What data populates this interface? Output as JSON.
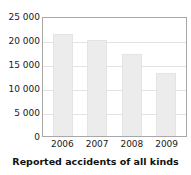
{
  "chart_data": {
    "type": "bar",
    "title": "Reported accidents of all kinds",
    "xlabel": "",
    "ylabel": "",
    "categories": [
      "2006",
      "2007",
      "2008",
      "2009"
    ],
    "values": [
      21200,
      20000,
      17100,
      13200
    ],
    "ylim": [
      0,
      25000
    ],
    "ytick_values": [
      25000,
      20000,
      15000,
      10000,
      5000,
      0
    ],
    "ytick_labels": [
      "25 000",
      "20 000",
      "15 000",
      "10 000",
      "5 000",
      "0"
    ],
    "grid": true,
    "grid_orientation": "horizontal",
    "legend": false,
    "legend_position": "none",
    "bar_color": "#ececec",
    "bar_border_color": "#e4e4e4",
    "gridline_color": "#e3e3e3",
    "axis_border_color": "#a8a8a8",
    "text_color": "#1a1a1a",
    "background_color": "#ffffff"
  }
}
